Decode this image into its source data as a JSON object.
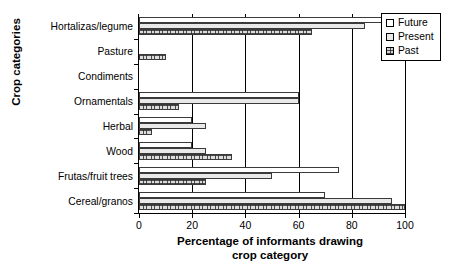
{
  "chart_data": {
    "type": "bar",
    "orientation": "horizontal",
    "title": "",
    "xlabel": "Percentage of informants drawing crop category",
    "ylabel": "Crop categories",
    "xlim": [
      0,
      100
    ],
    "xticks": [
      0,
      20,
      40,
      60,
      80,
      100
    ],
    "grid": "vertical",
    "legend_position": "top-right",
    "categories": [
      "Hortalizas/legume",
      "Pasture",
      "Condiments",
      "Ornamentals",
      "Herbal",
      "Wood",
      "Frutas/fruit trees",
      "Cereal/granos"
    ],
    "series": [
      {
        "name": "Future",
        "values": [
          100,
          0,
          0,
          60,
          20,
          20,
          75,
          70
        ]
      },
      {
        "name": "Present",
        "values": [
          85,
          0,
          0,
          60,
          25,
          25,
          50,
          95
        ]
      },
      {
        "name": "Past",
        "values": [
          65,
          10,
          0,
          15,
          5,
          35,
          25,
          100
        ]
      }
    ]
  },
  "axes": {
    "y_title": "Crop categories",
    "x_title_line1": "Percentage of informants drawing",
    "x_title_line2": "crop category"
  },
  "legend": {
    "items": [
      {
        "label": "Future",
        "swatch": "legend-swatch-future"
      },
      {
        "label": "Present",
        "swatch": "legend-swatch-present"
      },
      {
        "label": "Past",
        "swatch": "legend-swatch-past"
      }
    ]
  },
  "colors": {
    "axis": "#000000",
    "bar_outline": "#3a3a3a",
    "future_fill": "#ffffff",
    "present_fill": "#e9e9e9",
    "past_fill": "#dcdcdc",
    "background": "#ffffff"
  }
}
